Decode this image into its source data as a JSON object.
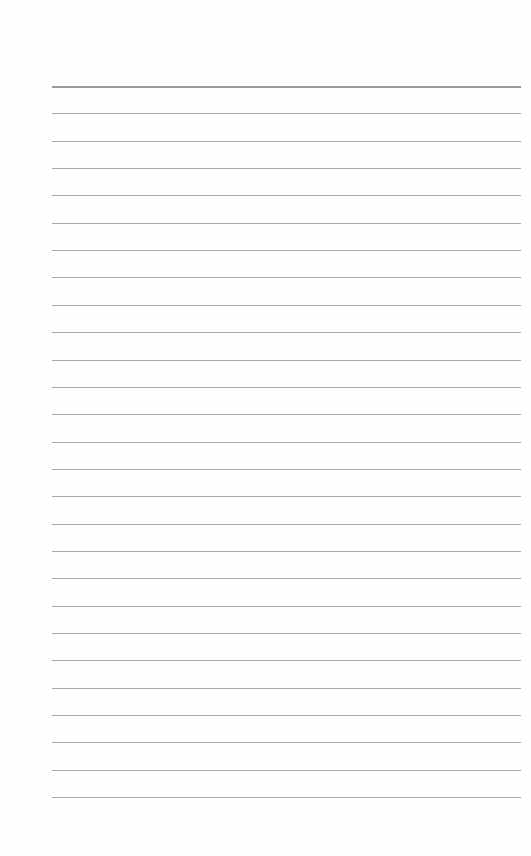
{
  "page": {
    "type": "lined-paper",
    "background": "#ffffff",
    "line_color": "#a8a8a8",
    "header_line_color": "#9a9a9a",
    "line_count": 27,
    "first_line_y": 86,
    "line_spacing": 27.35,
    "line_left": 52,
    "line_right": 521
  }
}
